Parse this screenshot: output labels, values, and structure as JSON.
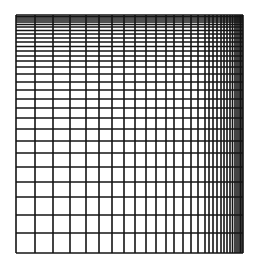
{
  "diagram": {
    "type": "non-uniform rectilinear mesh grid",
    "colors": {
      "background": "#ffffff",
      "line": "#141414"
    },
    "bounds": {
      "left": 16,
      "right": 243,
      "top": 15,
      "bottom": 253
    },
    "line_width": 1.6,
    "horizontal_lines_y": [
      15,
      16.5,
      18,
      20,
      22,
      24.5,
      27,
      30.5,
      34,
      38,
      42,
      46.5,
      51,
      56,
      61,
      67,
      74,
      82,
      90,
      99,
      108,
      118,
      129,
      141,
      153,
      167,
      182,
      197,
      215,
      233,
      253
    ],
    "vertical_lines_x": [
      16,
      35,
      53,
      70,
      86,
      99,
      112,
      124,
      135,
      146,
      156,
      166,
      174,
      183,
      191,
      198,
      205,
      209,
      213,
      217,
      221,
      224,
      227,
      230,
      232.5,
      235,
      237,
      239,
      240.5,
      242,
      243
    ]
  }
}
